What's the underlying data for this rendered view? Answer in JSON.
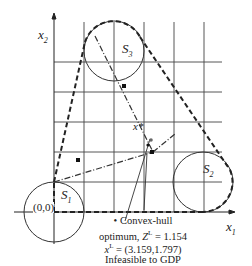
{
  "axes": {
    "x_label": "x",
    "x_sub": "1",
    "y_label": "x",
    "y_sub": "2",
    "origin_label": "(0,0)"
  },
  "sets": [
    {
      "name": "S",
      "sub": "1"
    },
    {
      "name": "S",
      "sub": "2"
    },
    {
      "name": "S",
      "sub": "3"
    }
  ],
  "point_label": "x*",
  "annotation": {
    "line1": "• Convex-hull",
    "line2_prefix": "optimum, ",
    "line2_var": "Z",
    "line2_sup": "L",
    "line2_value": " = 1.154",
    "line3_var": "x",
    "line3_sup": "L",
    "line3_value": " = (3.159,1.797)",
    "line4": "Infeasible to GDP"
  },
  "colors": {
    "line": "#222222",
    "grid": "#333333",
    "background": "#ffffff"
  }
}
